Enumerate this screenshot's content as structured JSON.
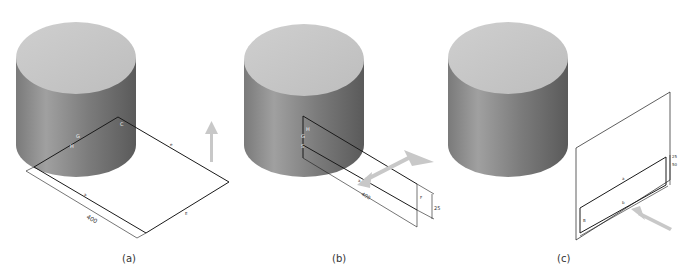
{
  "figure": {
    "panels": [
      {
        "id": "a",
        "caption": "(a)",
        "labels": {
          "dim": "400",
          "g": "G",
          "h": "H",
          "c": "C",
          "a": "a",
          "e": "e",
          "f": "E",
          "b": "a"
        },
        "arrow_direction": "up"
      },
      {
        "id": "b",
        "caption": "(b)",
        "labels": {
          "dim_length": "400",
          "dim_height": "25",
          "h": "H",
          "g": "G",
          "s": "S",
          "a": "a",
          "f": "F"
        },
        "arrow_direction": "diagonal-double"
      },
      {
        "id": "c",
        "caption": "(c)",
        "labels": {
          "dim_small": "25",
          "dim_height": "50",
          "a": "a",
          "b": "B",
          "c": "b"
        },
        "arrow_direction": "diagonal-up-left"
      }
    ],
    "colors": {
      "cylinder_top": "#c6c6c6",
      "cylinder_side_light": "#9a9a9a",
      "cylinder_side_dark": "#5e5e5e",
      "line": "#1a1a1a",
      "arrow": "#c8c8c8"
    }
  }
}
